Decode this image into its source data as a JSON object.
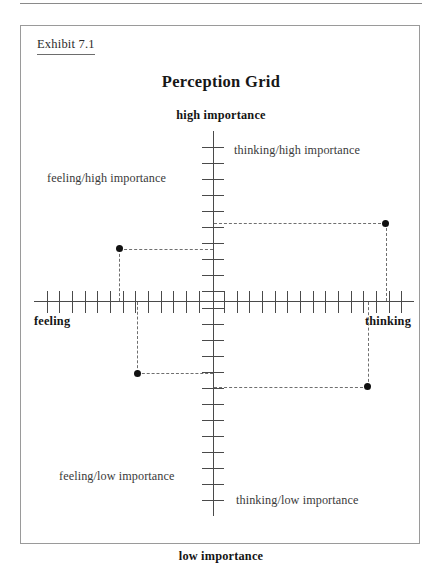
{
  "exhibit": {
    "caption": "Exhibit 7.1"
  },
  "chart_data": {
    "type": "scatter",
    "title": "Perception Grid",
    "xlabel": "",
    "ylabel": "",
    "grid": false,
    "legend": null,
    "axes": {
      "x_axis": {
        "left_label": "feeling",
        "right_label": "thinking",
        "tick_count": 30,
        "range_labels": [
          "feeling",
          "thinking"
        ]
      },
      "y_axis": {
        "top_label": "high importance",
        "bottom_label": "low importance",
        "tick_count": 24,
        "range_labels": [
          "low importance",
          "high importance"
        ]
      }
    },
    "points": [
      {
        "label": "feeling/high importance",
        "quadrant": "upper-left",
        "x_norm": -0.47,
        "y_norm": 0.31
      },
      {
        "label": "thinking/high importance",
        "quadrant": "upper-right",
        "x_norm": 0.86,
        "y_norm": 0.46
      },
      {
        "label": "feeling/low importance",
        "quadrant": "lower-left",
        "x_norm": -0.38,
        "y_norm": -0.42
      },
      {
        "label": "thinking/low importance",
        "quadrant": "lower-right",
        "x_norm": 0.77,
        "y_norm": -0.5
      }
    ],
    "annotations": [
      "dashed leader lines connect each point to both axes"
    ]
  },
  "colors": {
    "axis": "#4a4a4a",
    "point": "#111111",
    "leader": "#6f6f6f",
    "frame": "#9a9a9a",
    "text": "#231f20"
  }
}
